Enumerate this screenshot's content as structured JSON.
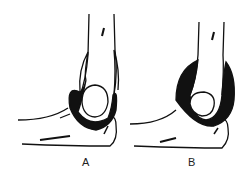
{
  "figure": {
    "panels": [
      {
        "label": "A",
        "description": "elbow joint, normal capsule"
      },
      {
        "label": "B",
        "description": "elbow joint, distended capsule"
      }
    ],
    "colors": {
      "ink": "#111111",
      "background": "#ffffff"
    }
  }
}
